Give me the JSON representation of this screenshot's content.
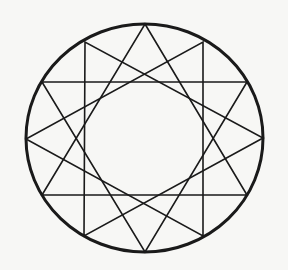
{
  "figure": {
    "type": "star-polygon",
    "notation": "{12/4}",
    "colors": {
      "background": "#f7f7f5",
      "stroke": "#1a1a1a"
    },
    "circle": {
      "cx": 144.5,
      "cy": 138,
      "rx": 118.5,
      "ry": 114,
      "stroke_width": 3
    },
    "line_width": 1.6,
    "vertices": [
      [
        145,
        24
      ],
      [
        203,
        42
      ],
      [
        247,
        82
      ],
      [
        263,
        138
      ],
      [
        247,
        195
      ],
      [
        203,
        236
      ],
      [
        145,
        252
      ],
      [
        84,
        236
      ],
      [
        42,
        195
      ],
      [
        26,
        139
      ],
      [
        42,
        82
      ],
      [
        85,
        42
      ]
    ],
    "triangles": [
      [
        0,
        4,
        8
      ],
      [
        1,
        5,
        9
      ],
      [
        2,
        6,
        10
      ],
      [
        3,
        7,
        11
      ]
    ]
  }
}
